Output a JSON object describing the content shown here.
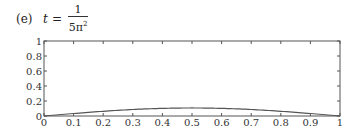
{
  "caption": {
    "label": "(e)",
    "variable": "t",
    "equals": "=",
    "numerator": "1",
    "denominator_base": "5π",
    "denominator_exp": "2"
  },
  "chart_data": {
    "type": "line",
    "xlabel": "",
    "ylabel": "",
    "xlim": [
      0,
      1
    ],
    "ylim": [
      0,
      1
    ],
    "x_ticks": [
      "0",
      "0.1",
      "0.2",
      "0.3",
      "0.4",
      "0.5",
      "0.6",
      "0.7",
      "0.8",
      "0.9",
      "1"
    ],
    "y_ticks": [
      "0",
      "0.2",
      "0.4",
      "0.6",
      "0.8",
      "1"
    ],
    "grid": false,
    "legend": null,
    "series": [
      {
        "name": "u(x,t)",
        "color": "#555555",
        "x": [
          0,
          0.1,
          0.2,
          0.3,
          0.4,
          0.5,
          0.6,
          0.7,
          0.8,
          0.9,
          1.0
        ],
        "y": [
          0,
          0.033,
          0.063,
          0.087,
          0.102,
          0.107,
          0.102,
          0.087,
          0.063,
          0.033,
          0
        ]
      }
    ]
  }
}
